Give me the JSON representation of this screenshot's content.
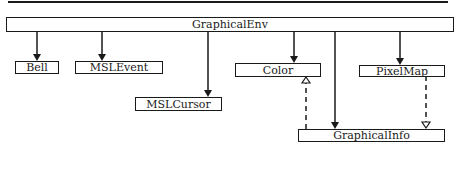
{
  "diagram": {
    "type": "class-hierarchy",
    "nodes": [
      {
        "id": "graphicalenv",
        "label": "GraphicalEnv"
      },
      {
        "id": "bell",
        "label": "Bell"
      },
      {
        "id": "mslevent",
        "label": "MSLEvent"
      },
      {
        "id": "mslcursor",
        "label": "MSLCursor"
      },
      {
        "id": "color",
        "label": "Color"
      },
      {
        "id": "pixelmap",
        "label": "PixelMap"
      },
      {
        "id": "graphicalinfo",
        "label": "GraphicalInfo"
      }
    ],
    "edges": [
      {
        "from": "graphicalenv",
        "to": "bell",
        "style": "solid",
        "head": "filled"
      },
      {
        "from": "graphicalenv",
        "to": "mslevent",
        "style": "solid",
        "head": "filled"
      },
      {
        "from": "graphicalenv",
        "to": "mslcursor",
        "style": "solid",
        "head": "filled"
      },
      {
        "from": "graphicalenv",
        "to": "color",
        "style": "solid",
        "head": "filled"
      },
      {
        "from": "graphicalenv",
        "to": "pixelmap",
        "style": "solid",
        "head": "filled"
      },
      {
        "from": "graphicalenv",
        "to": "graphicalinfo",
        "style": "solid",
        "head": "filled"
      },
      {
        "from": "graphicalinfo",
        "to": "color",
        "style": "dashed",
        "head": "open"
      },
      {
        "from": "graphicalinfo",
        "to": "pixelmap",
        "style": "dashed",
        "head": "open"
      }
    ]
  },
  "colors": {
    "line": "#1a1a1a",
    "background": "#ffffff"
  }
}
